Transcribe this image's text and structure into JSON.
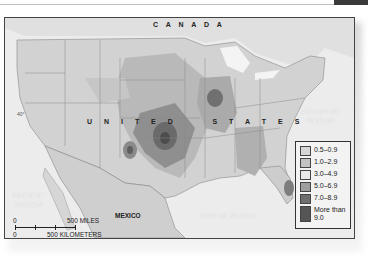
{
  "map": {
    "labels": {
      "canada": "C A N A D A",
      "united_states": "U N I T E D     S T A T E S",
      "mexico": "MEXICO",
      "atlantic": [
        "ATLANTIC",
        "OCEAN"
      ],
      "pacific": [
        "PACIFIC",
        "OCEAN"
      ],
      "gulf": "Gulf of Mexico",
      "lat40": "40°"
    },
    "scale": {
      "zero_miles": "0",
      "miles": "500 MILES",
      "zero_km": "0",
      "km": "500 KILOMETERS"
    },
    "legend": [
      {
        "label": "0.5–0.9",
        "color": "#d6d6d6"
      },
      {
        "label": "1.0–2.9",
        "color": "#c2c2c2"
      },
      {
        "label": "3.0–4.9",
        "color": "#e9e9e9"
      },
      {
        "label": "5.0–6.9",
        "color": "#9e9e9e"
      },
      {
        "label": "7.0–8.9",
        "color": "#6e6e6e"
      },
      {
        "label": "More than 9.0",
        "color": "#555555"
      }
    ]
  }
}
